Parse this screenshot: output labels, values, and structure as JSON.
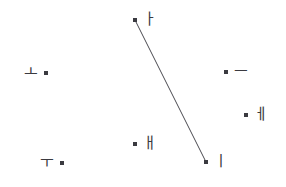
{
  "figure": {
    "type": "scatter",
    "width": 286,
    "height": 187,
    "background": "#ffffff",
    "ink_color": "#3a3a40"
  },
  "chart_data": {
    "type": "scatter",
    "title": "",
    "xlabel": "",
    "ylabel": "",
    "xlim": [
      0,
      286
    ],
    "ylim": [
      187,
      0
    ],
    "grid": false,
    "legend": "none",
    "point_color": "#3a3a40",
    "point_size": 4,
    "labels": [
      "ㅏ",
      "ㅗ",
      "ㅡ",
      "ㅔ",
      "ㅐ",
      "ㅜ",
      "ㅣ"
    ],
    "x": [
      135,
      46,
      226,
      246,
      135,
      62,
      206
    ],
    "y": [
      20,
      73,
      72,
      115,
      144,
      163,
      162
    ],
    "points": [
      {
        "label": "ㅏ",
        "x": 135,
        "y": 20,
        "label_side": "right"
      },
      {
        "label": "ㅗ",
        "x": 46,
        "y": 73,
        "label_side": "left"
      },
      {
        "label": "ㅡ",
        "x": 226,
        "y": 72,
        "label_side": "right"
      },
      {
        "label": "ㅔ",
        "x": 246,
        "y": 115,
        "label_side": "right"
      },
      {
        "label": "ㅐ",
        "x": 135,
        "y": 144,
        "label_side": "right"
      },
      {
        "label": "ㅜ",
        "x": 62,
        "y": 163,
        "label_side": "left"
      },
      {
        "label": "ㅣ",
        "x": 206,
        "y": 162,
        "label_side": "right"
      }
    ],
    "edges": [
      {
        "from": "ㅏ",
        "to": "ㅣ",
        "x1": 135,
        "y1": 20,
        "x2": 206,
        "y2": 162,
        "color": "#4a4a50",
        "width": 1
      }
    ]
  }
}
